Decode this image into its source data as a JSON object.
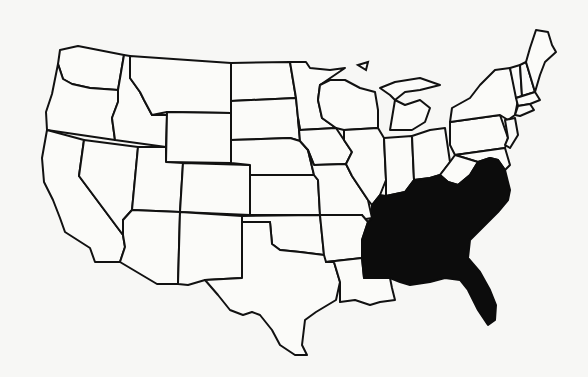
{
  "map": {
    "type": "outline-map",
    "region": "contiguous United States",
    "colors": {
      "background": "#f7f7f5",
      "state_fill": "#fbfbf9",
      "border": "#111111",
      "highlight": "#0c0c0c"
    },
    "highlighted_region": "Southeastern United States",
    "highlighted_states": [
      "Kentucky",
      "Tennessee",
      "Virginia",
      "North Carolina",
      "South Carolina",
      "Georgia",
      "Alabama",
      "Mississippi",
      "Florida"
    ],
    "states": [
      {
        "id": "WA",
        "name": "Washington",
        "d": "M60,50 L78,46 L124,55 L118,90 L90,88 L72,84 L63,79 L58,64 Z",
        "highlight": false
      },
      {
        "id": "OR",
        "name": "Oregon",
        "d": "M58,64 L63,79 L72,84 L90,88 L118,90 L118,102 L112,118 L115,140 L47,130 L46,112 L52,94 Z",
        "highlight": false
      },
      {
        "id": "CA",
        "name": "California",
        "d": "M47,130 L84,140 L79,176 L123,235 L125,247 L120,262 L95,262 L90,248 L65,232 L60,218 L53,200 L44,182 L42,158 Z",
        "highlight": false
      },
      {
        "id": "ID",
        "name": "Idaho",
        "d": "M124,55 L130,56 L130,78 L140,92 L144,100 L152,115 L167,115 L166,147 L115,140 L112,118 L118,102 L118,90 Z",
        "highlight": false
      },
      {
        "id": "NV",
        "name": "Nevada",
        "d": "M84,140 L138,147 L132,210 L123,220 L123,235 L79,176 Z",
        "highlight": false
      },
      {
        "id": "MT",
        "name": "Montana",
        "d": "M130,56 L231,63 L231,113 L167,112 L152,115 L144,100 L140,92 L130,78 Z",
        "highlight": false
      },
      {
        "id": "WY",
        "name": "Wyoming",
        "d": "M167,112 L231,113 L231,163 L166,162 Z",
        "highlight": false
      },
      {
        "id": "UT",
        "name": "Utah",
        "d": "M138,147 L166,147 L166,162 L183,163 L180,212 L132,210 Z",
        "highlight": false
      },
      {
        "id": "AZ",
        "name": "Arizona",
        "d": "M132,210 L180,212 L178,284 L157,284 L120,262 L125,247 L123,235 L123,220 Z",
        "highlight": false
      },
      {
        "id": "CO",
        "name": "Colorado",
        "d": "M183,163 L250,165 L250,215 L180,212 Z",
        "highlight": false
      },
      {
        "id": "NM",
        "name": "New Mexico",
        "d": "M180,212 L242,216 L242,278 L205,280 L188,285 L178,284 Z",
        "highlight": false
      },
      {
        "id": "ND",
        "name": "North Dakota",
        "d": "M231,63 L290,62 L296,98 L231,101 Z",
        "highlight": false
      },
      {
        "id": "SD",
        "name": "South Dakota",
        "d": "M231,101 L296,98 L298,118 L300,141 L290,138 L231,140 Z",
        "highlight": false
      },
      {
        "id": "NE",
        "name": "Nebraska",
        "d": "M231,140 L290,138 L300,141 L308,150 L314,175 L250,175 L250,165 L231,163 Z",
        "highlight": false
      },
      {
        "id": "KS",
        "name": "Kansas",
        "d": "M250,175 L314,175 L318,180 L320,215 L250,215 Z",
        "highlight": false
      },
      {
        "id": "OK",
        "name": "Oklahoma",
        "d": "M242,216 L320,215 L322,235 L324,255 L300,252 L280,250 L272,244 L270,222 L242,222 Z",
        "highlight": false
      },
      {
        "id": "TX",
        "name": "Texas",
        "d": "M242,222 L270,222 L272,244 L280,250 L300,252 L324,255 L334,262 L340,282 L336,300 L316,312 L305,320 L302,345 L307,355 L295,355 L280,345 L272,330 L260,315 L252,312 L243,315 L230,310 L218,295 L205,280 L242,278 Z",
        "highlight": false
      },
      {
        "id": "MN",
        "name": "Minnesota",
        "d": "M290,62 L306,62 L310,68 L330,70 L345,68 L320,85 L318,100 L322,118 L336,128 L300,130 L298,118 L296,98 Z",
        "highlight": false
      },
      {
        "id": "IA",
        "name": "Iowa",
        "d": "M298,118 L300,130 L336,128 L344,140 L352,152 L346,164 L314,165 L308,150 L300,141 Z",
        "highlight": false
      },
      {
        "id": "MO",
        "name": "Missouri",
        "d": "M308,150 L314,165 L346,164 L352,176 L360,188 L368,200 L372,218 L360,220 L362,215 L320,215 L318,180 L314,175 Z",
        "highlight": false
      },
      {
        "id": "AR",
        "name": "Arkansas",
        "d": "M320,215 L362,215 L368,222 L362,240 L362,258 L326,262 L324,255 L322,235 Z",
        "highlight": false
      },
      {
        "id": "LA",
        "name": "Louisiana",
        "d": "M326,262 L362,258 L364,278 L390,278 L392,288 L395,300 L380,302 L370,305 L355,300 L340,302 L340,282 L334,262 Z",
        "highlight": false
      },
      {
        "id": "WI",
        "name": "Wisconsin",
        "d": "M330,80 L345,80 L360,88 L375,92 L378,110 L378,128 L344,130 L336,128 L322,118 L318,100 L320,85 Z",
        "highlight": false
      },
      {
        "id": "IL",
        "name": "Illinois",
        "d": "M344,130 L378,128 L384,138 L386,180 L380,195 L372,205 L368,200 L360,188 L352,176 L346,164 L352,152 L344,140 Z",
        "highlight": false
      },
      {
        "id": "MI",
        "name": "Michigan",
        "d": "M380,88 L395,82 L420,78 L440,85 L420,90 L405,92 L395,100 L390,130 L412,130 L425,122 L430,108 L420,100 L405,105 L395,100 L390,95 Z",
        "highlight": false
      },
      {
        "id": "IN",
        "name": "Indiana",
        "d": "M384,138 L412,136 L414,180 L405,192 L386,196 L386,180 Z",
        "highlight": false
      },
      {
        "id": "OH",
        "name": "Ohio",
        "d": "M412,136 L430,130 L445,128 L450,162 L440,175 L430,178 L414,180 Z",
        "highlight": false
      },
      {
        "id": "PA",
        "name": "Pennsylvania",
        "d": "M450,122 L500,115 L508,138 L505,148 L455,155 L450,145 Z",
        "highlight": false
      },
      {
        "id": "NY",
        "name": "New York",
        "d": "M452,108 L470,98 L480,85 L495,70 L510,68 L518,100 L515,115 L508,120 L500,115 L450,122 Z",
        "highlight": false
      },
      {
        "id": "VT",
        "name": "Vermont",
        "d": "M510,68 L520,65 L522,96 L516,98 Z",
        "highlight": false
      },
      {
        "id": "NH",
        "name": "New Hampshire",
        "d": "M520,65 L526,62 L535,92 L522,96 Z",
        "highlight": false
      },
      {
        "id": "ME",
        "name": "Maine",
        "d": "M526,62 L530,48 L536,30 L548,32 L552,45 L556,52 L545,62 L540,75 L535,92 Z",
        "highlight": false
      },
      {
        "id": "MA",
        "name": "Massachusetts",
        "d": "M516,98 L535,92 L540,100 L530,104 L518,106 Z",
        "highlight": false
      },
      {
        "id": "CT_RI",
        "name": "Connecticut / Rhode Island",
        "d": "M518,106 L530,104 L534,110 L520,116 L515,115 Z",
        "highlight": false
      },
      {
        "id": "NJ",
        "name": "New Jersey",
        "d": "M505,120 L515,118 L518,135 L510,148 L505,145 L508,138 Z",
        "highlight": false
      },
      {
        "id": "DE_MD",
        "name": "Delaware / Maryland",
        "d": "M455,155 L505,148 L510,165 L505,170 L498,160 L490,158 L478,162 L465,158 Z",
        "highlight": false
      },
      {
        "id": "WV",
        "name": "West Virginia",
        "d": "M450,162 L455,155 L465,158 L478,162 L470,175 L458,185 L448,182 L440,175 Z",
        "highlight": false
      },
      {
        "id": "SE",
        "name": "Southeast (KY, TN, VA, NC, SC, GA, AL, MS, FL)",
        "d": "M386,196 L405,192 L414,180 L430,178 L440,175 L448,182 L458,185 L470,175 L478,162 L490,158 L498,160 L505,170 L510,190 L508,200 L498,212 L488,222 L478,232 L470,240 L468,258 L480,272 L490,290 L496,305 L495,320 L488,325 L478,310 L468,290 L460,280 L445,278 L430,282 L410,285 L400,282 L390,278 L364,278 L362,258 L362,240 L368,222 L372,218 L372,205 L380,195 Z",
        "highlight": true
      }
    ],
    "lakes": [
      {
        "id": "lake-superior-isle",
        "d": "M358,65 L368,62 L366,70 Z"
      }
    ]
  }
}
